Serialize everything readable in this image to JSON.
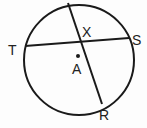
{
  "diagram": {
    "circle": {
      "center_label": "A",
      "cx": 79,
      "cy": 60,
      "r": 55
    },
    "chords": [
      {
        "name": "TS",
        "from": [
          25,
          46
        ],
        "to": [
          129,
          38
        ]
      },
      {
        "name": "QR",
        "from": [
          68,
          3
        ],
        "to": [
          102,
          104
        ]
      }
    ],
    "labels": {
      "T": "T",
      "S": "S",
      "R": "R",
      "X": "X",
      "A": "A"
    },
    "stroke_color": "#1a1a1a"
  }
}
